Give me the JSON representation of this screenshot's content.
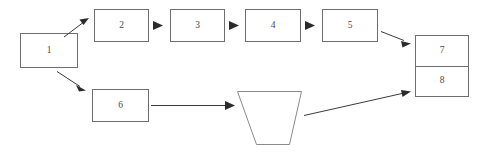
{
  "diagram": {
    "background_color": "#ffffff",
    "node_stroke_color": "#6e6e6e",
    "edge_color": "#3b3b3b",
    "label_color": "#4a4a4a",
    "nodes": [
      {
        "id": "n1",
        "label": "1",
        "shape": "rectangle",
        "x": 20,
        "y": 33,
        "w": 57,
        "h": 34
      },
      {
        "id": "n2",
        "label": "2",
        "shape": "rectangle",
        "x": 94,
        "y": 9,
        "w": 54,
        "h": 32
      },
      {
        "id": "n3",
        "label": "3",
        "shape": "rectangle",
        "x": 170,
        "y": 9,
        "w": 54,
        "h": 32
      },
      {
        "id": "n4",
        "label": "4",
        "shape": "rectangle",
        "x": 245,
        "y": 9,
        "w": 55,
        "h": 32
      },
      {
        "id": "n5",
        "label": "5",
        "shape": "rectangle",
        "x": 322,
        "y": 9,
        "w": 55,
        "h": 32
      },
      {
        "id": "n6",
        "label": "6",
        "shape": "rectangle",
        "x": 92,
        "y": 89,
        "w": 56,
        "h": 32
      },
      {
        "id": "n7",
        "label": "7",
        "shape": "rectangle",
        "x": 415,
        "y": 35,
        "w": 53,
        "h": 31
      },
      {
        "id": "n8",
        "label": "8",
        "shape": "rectangle",
        "x": 415,
        "y": 66,
        "w": 53,
        "h": 30
      },
      {
        "id": "n9",
        "label": "",
        "shape": "trapezoid",
        "x": 237,
        "y": 91,
        "w": 64,
        "h": 53
      }
    ],
    "edges": [
      {
        "id": "e1",
        "from": "n1",
        "to": "n2",
        "style": "diagonal-up"
      },
      {
        "id": "e2",
        "from": "n2",
        "to": "n3",
        "style": "horizontal"
      },
      {
        "id": "e3",
        "from": "n3",
        "to": "n4",
        "style": "horizontal"
      },
      {
        "id": "e4",
        "from": "n4",
        "to": "n5",
        "style": "horizontal"
      },
      {
        "id": "e5",
        "from": "n5",
        "to": "n7",
        "style": "diagonal-down"
      },
      {
        "id": "e6",
        "from": "n1",
        "to": "n6",
        "style": "diagonal-down"
      },
      {
        "id": "e7",
        "from": "n6",
        "to": "n9",
        "style": "horizontal"
      },
      {
        "id": "e8",
        "from": "n9",
        "to": "n8",
        "style": "diagonal-up"
      }
    ]
  }
}
